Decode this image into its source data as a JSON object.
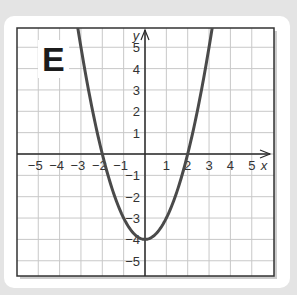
{
  "panel": {
    "label": "E"
  },
  "chart_data": {
    "type": "line",
    "title": "",
    "panel_label": "E",
    "xlabel": "x",
    "ylabel": "y",
    "xlim": [
      -5.9,
      6.1
    ],
    "ylim": [
      -5.8,
      5.9
    ],
    "grid": true,
    "x_ticks": [
      -5,
      -4,
      -3,
      -2,
      -1,
      1,
      2,
      3,
      4,
      5
    ],
    "y_ticks": [
      5,
      4,
      3,
      2,
      1,
      -1,
      -2,
      -3,
      -4,
      -5
    ],
    "x_tick_labels": [
      "−5",
      "−4",
      "−3",
      "−2",
      "−1",
      "1",
      "2",
      "3",
      "4",
      "5"
    ],
    "y_tick_labels": [
      "5",
      "4",
      "3",
      "2",
      "1",
      "−1",
      "−2",
      "−3",
      "−4",
      "−5"
    ],
    "series": [
      {
        "name": "y = x^2 - 4",
        "x": [
          -3.1,
          -3,
          -2.5,
          -2,
          -1.5,
          -1,
          -0.5,
          0,
          0.5,
          1,
          1.5,
          2,
          2.5,
          3,
          3.1
        ],
        "values": [
          5.61,
          5,
          2.25,
          0,
          -1.75,
          -3,
          -3.75,
          -4,
          -3.75,
          -3,
          -1.75,
          0,
          2.25,
          5,
          5.61
        ],
        "color": "#4a4a4a"
      }
    ],
    "annotations": [
      "x-intercepts at -2 and 2",
      "vertex at (0, -4)"
    ]
  },
  "colors": {
    "grid": "#c8c8c8",
    "axis": "#2a2a2a",
    "curve": "#4a4a4a",
    "border": "#333333"
  }
}
